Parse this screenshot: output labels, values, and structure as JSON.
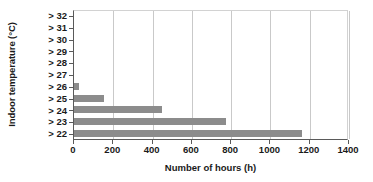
{
  "chart_data": {
    "type": "bar",
    "orientation": "horizontal",
    "title": "",
    "xlabel": "Number of hours (h)",
    "ylabel": "Indoor temperature (°C)",
    "categories": [
      "> 32",
      "> 31",
      "> 30",
      "> 29",
      "> 28",
      "> 27",
      "> 26",
      "> 25",
      "> 24",
      "> 23",
      "> 22"
    ],
    "values": [
      0,
      0,
      0,
      0,
      0,
      0,
      25,
      155,
      450,
      775,
      1160
    ],
    "xlim": [
      0,
      1400
    ],
    "xticks": [
      0,
      200,
      400,
      600,
      800,
      1000,
      1200,
      1400
    ],
    "xtick_labels": [
      "0",
      "200",
      "400",
      "600",
      "800",
      "1000",
      "1200",
      "1400"
    ],
    "grid": "vertical",
    "legend": "none",
    "bar_color": "#8c8c8c",
    "axis_color": "#5a5a5a",
    "gridline_color": "#c9c9c9"
  }
}
